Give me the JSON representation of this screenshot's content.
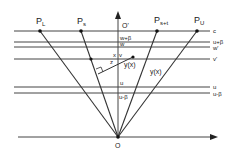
{
  "points": {
    "PL": "P",
    "PL_sub": "L",
    "Ps": "P",
    "Ps_sub": "s",
    "Pst": "P",
    "Pst_sub": "s+t",
    "PU": "P",
    "PU_sub": "U",
    "O_top": "O'",
    "O": "O"
  },
  "axis_labels": {
    "w_beta": "w+β",
    "w": "w",
    "x": "x",
    "v": "v",
    "z": "z",
    "yx_axis": "y(x)",
    "yx_right": "y(x)",
    "u": "u",
    "u_beta": "u-β"
  },
  "line_labels": {
    "c": "c",
    "u_beta_plus": "u+β",
    "w_prime": "w'",
    "v_prime": "v'",
    "u": "u",
    "u_beta_minus": "u-β"
  },
  "colors": {
    "line": "#333333",
    "text": "#222222"
  }
}
